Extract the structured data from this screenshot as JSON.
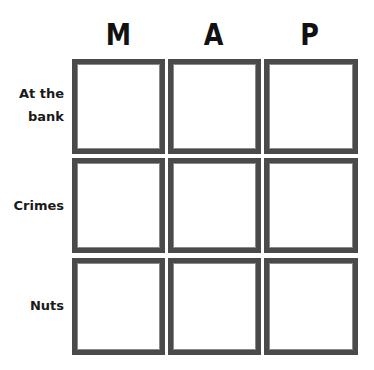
{
  "grid": {
    "columns": [
      {
        "header": "M"
      },
      {
        "header": "A"
      },
      {
        "header": "P"
      }
    ],
    "rows": [
      {
        "label_line1": "At the",
        "label_line2": "bank"
      },
      {
        "label_line1": "Crimes",
        "label_line2": ""
      },
      {
        "label_line1": "Nuts",
        "label_line2": ""
      }
    ],
    "cells": [
      [
        "",
        "",
        ""
      ],
      [
        "",
        "",
        ""
      ],
      [
        "",
        "",
        ""
      ]
    ]
  },
  "colors": {
    "border": "#4a4a4a",
    "text": "#111111",
    "background": "#ffffff"
  }
}
